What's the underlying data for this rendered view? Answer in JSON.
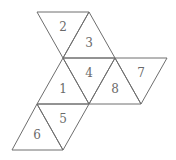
{
  "diagram": {
    "type": "octahedron-net",
    "vertices": {
      "A": [
        37,
        12
      ],
      "B": [
        89,
        12
      ],
      "C": [
        63,
        58
      ],
      "D": [
        115,
        58
      ],
      "E": [
        167,
        58
      ],
      "F": [
        37,
        104
      ],
      "G": [
        89,
        104
      ],
      "H": [
        141,
        104
      ],
      "I": [
        12,
        150
      ],
      "J": [
        63,
        150
      ]
    },
    "faces": [
      {
        "label": "2",
        "points": "37,12 89,12 63,58",
        "lx": 63,
        "ly": 27
      },
      {
        "label": "3",
        "points": "89,12 63,58 115,58",
        "lx": 89,
        "ly": 43
      },
      {
        "label": "1",
        "points": "63,58 37,104 89,104",
        "lx": 63,
        "ly": 89
      },
      {
        "label": "4",
        "points": "63,58 115,58 89,104",
        "lx": 89,
        "ly": 73
      },
      {
        "label": "8",
        "points": "115,58 89,104 141,104",
        "lx": 115,
        "ly": 89
      },
      {
        "label": "7",
        "points": "115,58 167,58 141,104",
        "lx": 141,
        "ly": 73
      },
      {
        "label": "5",
        "points": "37,104 89,104 63,150",
        "lx": 63,
        "ly": 119
      },
      {
        "label": "6",
        "points": "37,104 12,150 63,150",
        "lx": 37,
        "ly": 135
      }
    ]
  }
}
